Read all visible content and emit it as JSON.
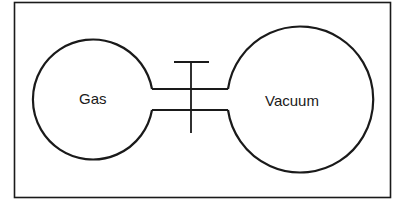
{
  "diagram": {
    "type": "free-expansion apparatus",
    "left_bulb": {
      "label": "Gas"
    },
    "right_bulb": {
      "label": "Vacuum"
    },
    "connector": {
      "label": "",
      "valve": "stopcock"
    },
    "colors": {
      "stroke": "#1a1a1a",
      "background": "#ffffff"
    }
  }
}
